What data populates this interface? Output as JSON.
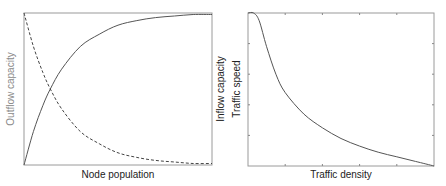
{
  "chart_data": [
    {
      "type": "line",
      "title": "",
      "xlabel": "Node population",
      "ylabel_left": "Outflow capacity",
      "ylabel_right": "Inflow capacity",
      "grid": false,
      "legend": null,
      "xlim": [
        0,
        1
      ],
      "ylim": [
        0,
        1
      ],
      "x": [
        0,
        0.05,
        0.1,
        0.14,
        0.2,
        0.3,
        0.4,
        0.5,
        0.6,
        0.7,
        0.8,
        0.9,
        1.0
      ],
      "series": [
        {
          "name": "Inflow capacity",
          "style": "solid",
          "axis": "right",
          "values": [
            0,
            0.22,
            0.39,
            0.5,
            0.63,
            0.78,
            0.86,
            0.92,
            0.95,
            0.97,
            0.98,
            0.99,
            0.99
          ]
        },
        {
          "name": "Outflow capacity",
          "style": "dashed",
          "axis": "left",
          "values": [
            1,
            0.78,
            0.61,
            0.5,
            0.37,
            0.22,
            0.14,
            0.08,
            0.05,
            0.03,
            0.02,
            0.01,
            0.01
          ]
        }
      ]
    },
    {
      "type": "line",
      "title": "",
      "xlabel": "Traffic density",
      "ylabel": "Traffic speed",
      "grid": false,
      "legend": null,
      "xlim": [
        0,
        1
      ],
      "ylim": [
        0,
        1
      ],
      "x": [
        0,
        0.03,
        0.06,
        0.1,
        0.15,
        0.2,
        0.3,
        0.4,
        0.5,
        0.6,
        0.7,
        0.8,
        0.9,
        1.0
      ],
      "series": [
        {
          "name": "Traffic speed",
          "style": "solid",
          "values": [
            1,
            1,
            0.95,
            0.78,
            0.6,
            0.48,
            0.34,
            0.25,
            0.18,
            0.13,
            0.09,
            0.06,
            0.03,
            0
          ]
        }
      ]
    }
  ],
  "labels": {
    "left_xlabel": "Node population",
    "left_ylabel": "Outflow capacity",
    "left_ylabel_right": "Inflow capacity",
    "right_xlabel": "Traffic density",
    "right_ylabel": "Traffic speed"
  },
  "colors": {
    "frame": "#9a9a9a",
    "curve": "#555555",
    "label_dark": "#222222",
    "label_light": "#8a8a8a"
  }
}
